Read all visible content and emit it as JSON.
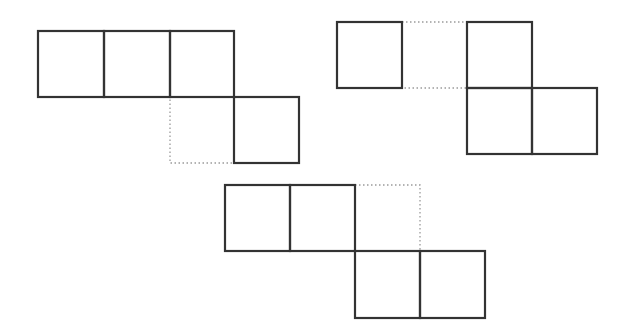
{
  "diagram": {
    "colors": {
      "background": "#ffffff",
      "solid_stroke": "#333333",
      "dotted_stroke": "#9a9a9a"
    },
    "stroke": {
      "solid_width": 2.2,
      "dotted_width": 1.3,
      "dotted_dash": "1.5 2.5"
    },
    "figures": [
      {
        "name": "figure-left",
        "solid_cells": [
          {
            "x": 38,
            "y": 31,
            "w": 66,
            "h": 66
          },
          {
            "x": 104,
            "y": 31,
            "w": 66,
            "h": 66
          },
          {
            "x": 170,
            "y": 31,
            "w": 64,
            "h": 66
          },
          {
            "x": 234,
            "y": 97,
            "w": 65,
            "h": 66
          }
        ],
        "dotted_cells": [
          {
            "x": 170,
            "y": 97,
            "w": 64,
            "h": 66
          }
        ]
      },
      {
        "name": "figure-right",
        "solid_cells": [
          {
            "x": 337,
            "y": 22,
            "w": 65,
            "h": 66
          },
          {
            "x": 467,
            "y": 22,
            "w": 65,
            "h": 66
          },
          {
            "x": 467,
            "y": 88,
            "w": 65,
            "h": 66
          },
          {
            "x": 532,
            "y": 88,
            "w": 65,
            "h": 66
          }
        ],
        "dotted_cells": [
          {
            "x": 402,
            "y": 22,
            "w": 65,
            "h": 66
          }
        ]
      },
      {
        "name": "figure-bottom",
        "solid_cells": [
          {
            "x": 225,
            "y": 185,
            "w": 65,
            "h": 66
          },
          {
            "x": 290,
            "y": 185,
            "w": 65,
            "h": 66
          },
          {
            "x": 355,
            "y": 251,
            "w": 65,
            "h": 67
          },
          {
            "x": 420,
            "y": 251,
            "w": 65,
            "h": 67
          }
        ],
        "dotted_cells": [
          {
            "x": 355,
            "y": 185,
            "w": 65,
            "h": 66
          }
        ]
      }
    ]
  }
}
